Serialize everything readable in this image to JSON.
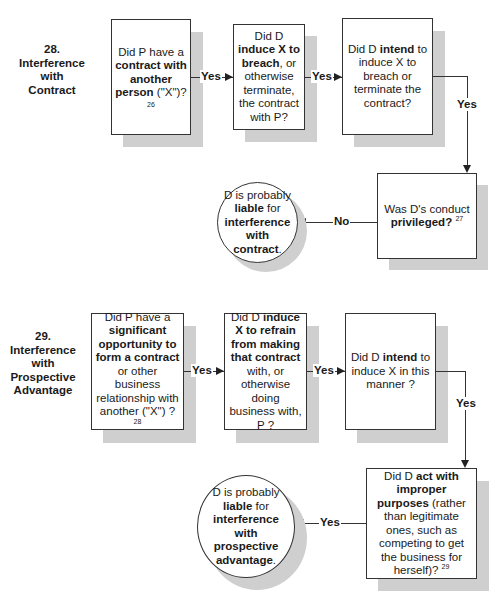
{
  "sections": [
    {
      "number": "28.",
      "title_lines": [
        "Interference",
        "with",
        "Contract"
      ],
      "nodes": {
        "q1": {
          "parts": [
            {
              "text": "Did P have a ",
              "bold": false
            },
            {
              "text": "contract with another person",
              "bold": true
            },
            {
              "text": " (\"X\")?",
              "bold": false
            }
          ],
          "footnote": "26"
        },
        "q2": {
          "parts": [
            {
              "text": "Did D ",
              "bold": false
            },
            {
              "text": "induce X to breach",
              "bold": true
            },
            {
              "text": ", or otherwise terminate, the contract with P?",
              "bold": false
            }
          ]
        },
        "q3": {
          "parts": [
            {
              "text": "Did D ",
              "bold": false
            },
            {
              "text": "intend",
              "bold": true
            },
            {
              "text": " to induce X to breach or terminate the contract?",
              "bold": false
            }
          ]
        },
        "q4": {
          "parts": [
            {
              "text": "Was D's conduct ",
              "bold": false
            },
            {
              "text": "privileged",
              "bold": true
            },
            {
              "text": "?",
              "bold": true
            }
          ],
          "footnote": "27"
        },
        "result": {
          "parts": [
            {
              "text": "D is probably ",
              "bold": false
            },
            {
              "text": "liable",
              "bold": true
            },
            {
              "text": " for ",
              "bold": false
            },
            {
              "text": "interference with contract",
              "bold": true
            },
            {
              "text": ".",
              "bold": false
            }
          ]
        }
      },
      "edges": {
        "q1_q2": "Yes",
        "q2_q3": "Yes",
        "q3_q4": "Yes",
        "q4_result": "No"
      }
    },
    {
      "number": "29.",
      "title_lines": [
        "Interference",
        "with",
        "Prospective",
        "Advantage"
      ],
      "nodes": {
        "q1": {
          "parts": [
            {
              "text": "Did P have a ",
              "bold": false
            },
            {
              "text": "significant opportunity to form a contract",
              "bold": true
            },
            {
              "text": " or other business relationship with another (\"X\") ?",
              "bold": false
            }
          ],
          "footnote": "28"
        },
        "q2": {
          "parts": [
            {
              "text": "Did D ",
              "bold": false
            },
            {
              "text": "induce X to refrain from making that contract",
              "bold": true
            },
            {
              "text": " with, or otherwise doing business with, P ?",
              "bold": false
            }
          ]
        },
        "q3": {
          "parts": [
            {
              "text": "Did D ",
              "bold": false
            },
            {
              "text": "intend",
              "bold": true
            },
            {
              "text": " to induce X in this manner ?",
              "bold": false
            }
          ]
        },
        "q4": {
          "parts": [
            {
              "text": "Did D ",
              "bold": false
            },
            {
              "text": "act with improper purposes",
              "bold": true
            },
            {
              "text": " (rather than legitimate ones, such as competing to get the business for herself)?",
              "bold": false
            }
          ],
          "footnote": "29"
        },
        "result": {
          "parts": [
            {
              "text": "D is probably ",
              "bold": false
            },
            {
              "text": "liable",
              "bold": true
            },
            {
              "text": " for ",
              "bold": false
            },
            {
              "text": "interference with prospective advantage",
              "bold": true
            },
            {
              "text": ".",
              "bold": false
            }
          ]
        }
      },
      "edges": {
        "q1_q2": "Yes",
        "q2_q3": "Yes",
        "q3_q4": "Yes",
        "q4_result": "Yes"
      }
    }
  ]
}
